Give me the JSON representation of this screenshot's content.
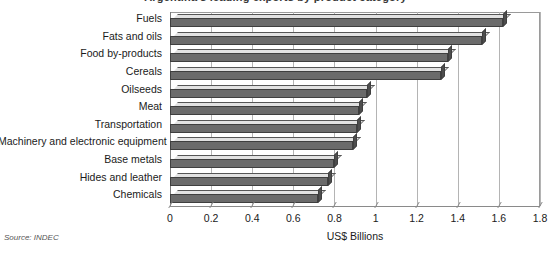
{
  "chart_data": {
    "type": "bar",
    "orientation": "horizontal",
    "title": "Argentina's leading exports by product category",
    "xlabel": "US$ Billions",
    "ylabel": "",
    "xlim": [
      0,
      1.8
    ],
    "xticks": [
      "0",
      "0.2",
      "0.4",
      "0.6",
      "0.8",
      "1",
      "1.2",
      "1.4",
      "1.6",
      "1.8"
    ],
    "xtick_values": [
      0,
      0.2,
      0.4,
      0.6,
      0.8,
      1.0,
      1.2,
      1.4,
      1.6,
      1.8
    ],
    "grid": "vertical",
    "legend": "none",
    "categories": [
      "Fuels",
      "Fats and oils",
      "Food by-products",
      "Cereals",
      "Oilseeds",
      "Meat",
      "Transportation",
      "Machinery and electronic equipment",
      "Base metals",
      "Hides and leather",
      "Chemicals"
    ],
    "values": [
      1.62,
      1.52,
      1.35,
      1.32,
      0.96,
      0.92,
      0.91,
      0.89,
      0.8,
      0.77,
      0.72
    ],
    "source": "Source: INDEC"
  },
  "colors": {
    "bar_front": "#6b6b6b",
    "bar_top": "#e2e2e2",
    "bar_cap": "#4d4d4d",
    "bar_outline": "#3f3f3f",
    "gridline": "#b4b4b4",
    "axis": "#8a8a8a",
    "text": "#1a1a1a",
    "background": "#ffffff"
  }
}
